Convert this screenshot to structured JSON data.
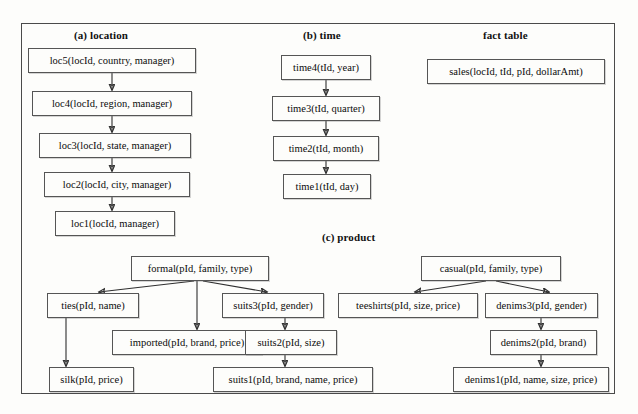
{
  "figure": {
    "sections": [
      {
        "id": "location",
        "label": "(a) location",
        "x": 74,
        "y": 29
      },
      {
        "id": "time",
        "label": "(b) time",
        "x": 303,
        "y": 29
      },
      {
        "id": "fact",
        "label": "fact table",
        "x": 483,
        "y": 29
      },
      {
        "id": "product",
        "label": "(c) product",
        "x": 322,
        "y": 231
      }
    ],
    "nodes": [
      {
        "id": "loc5",
        "label": "loc5(locId, country, manager)",
        "x": 28,
        "y": 48,
        "w": 168,
        "h": 25
      },
      {
        "id": "loc4",
        "label": "loc4(locId, region, manager)",
        "x": 32,
        "y": 91,
        "w": 160,
        "h": 25
      },
      {
        "id": "loc3",
        "label": "loc3(locId, state, manager)",
        "x": 39,
        "y": 133,
        "w": 152,
        "h": 25
      },
      {
        "id": "loc2",
        "label": "loc2(locId, city, manager)",
        "x": 44,
        "y": 172,
        "w": 146,
        "h": 25
      },
      {
        "id": "loc1",
        "label": "loc1(locId, manager)",
        "x": 55,
        "y": 211,
        "w": 120,
        "h": 25
      },
      {
        "id": "time4",
        "label": "time4(tId, year)",
        "x": 281,
        "y": 55,
        "w": 90,
        "h": 25
      },
      {
        "id": "time3",
        "label": "time3(tId, quarter)",
        "x": 272,
        "y": 96,
        "w": 108,
        "h": 25
      },
      {
        "id": "time2",
        "label": "time2(tId, month)",
        "x": 273,
        "y": 136,
        "w": 106,
        "h": 25
      },
      {
        "id": "time1",
        "label": "time1(tId, day)",
        "x": 283,
        "y": 174,
        "w": 88,
        "h": 25
      },
      {
        "id": "sales",
        "label": "sales(locId, tId, pId, dollarAmt)",
        "x": 427,
        "y": 59,
        "w": 178,
        "h": 25
      },
      {
        "id": "formal",
        "label": "formal(pId, family, type)",
        "x": 131,
        "y": 256,
        "w": 138,
        "h": 25
      },
      {
        "id": "ties",
        "label": "ties(pId, name)",
        "x": 47,
        "y": 293,
        "w": 92,
        "h": 25
      },
      {
        "id": "imported",
        "label": "imported(pId, brand, price)",
        "x": 112,
        "y": 330,
        "w": 150,
        "h": 25
      },
      {
        "id": "silk",
        "label": "silk(pId, price)",
        "x": 49,
        "y": 367,
        "w": 85,
        "h": 25
      },
      {
        "id": "suits3",
        "label": "suits3(pId, gender)",
        "x": 222,
        "y": 293,
        "w": 102,
        "h": 25
      },
      {
        "id": "suits2",
        "label": "suits2(pId, size)",
        "x": 245,
        "y": 330,
        "w": 92,
        "h": 25
      },
      {
        "id": "suits1",
        "label": "suits1(pId, brand, name, price)",
        "x": 213,
        "y": 367,
        "w": 160,
        "h": 25
      },
      {
        "id": "casual",
        "label": "casual(pId, family, type)",
        "x": 421,
        "y": 256,
        "w": 140,
        "h": 25
      },
      {
        "id": "teeshirts",
        "label": "teeshirts(pId, size, price)",
        "x": 338,
        "y": 293,
        "w": 140,
        "h": 25
      },
      {
        "id": "denims3",
        "label": "denims3(pId, gender)",
        "x": 485,
        "y": 293,
        "w": 113,
        "h": 25
      },
      {
        "id": "denims2",
        "label": "denims2(pId, brand)",
        "x": 490,
        "y": 330,
        "w": 107,
        "h": 25
      },
      {
        "id": "denims1",
        "label": "denims1(pId, name, size, price)",
        "x": 453,
        "y": 367,
        "w": 156,
        "h": 25
      }
    ],
    "edges": [
      {
        "from": "loc5",
        "to": "loc4",
        "kind": "vertical",
        "x": 112,
        "y1": 73,
        "y2": 91
      },
      {
        "from": "loc4",
        "to": "loc3",
        "kind": "vertical",
        "x": 112,
        "y1": 116,
        "y2": 133
      },
      {
        "from": "loc3",
        "to": "loc2",
        "kind": "vertical",
        "x": 112,
        "y1": 158,
        "y2": 172
      },
      {
        "from": "loc2",
        "to": "loc1",
        "kind": "vertical",
        "x": 112,
        "y1": 197,
        "y2": 211
      },
      {
        "from": "time4",
        "to": "time3",
        "kind": "vertical",
        "x": 326,
        "y1": 80,
        "y2": 96
      },
      {
        "from": "time3",
        "to": "time2",
        "kind": "vertical",
        "x": 326,
        "y1": 121,
        "y2": 136
      },
      {
        "from": "time2",
        "to": "time1",
        "kind": "vertical",
        "x": 326,
        "y1": 161,
        "y2": 174
      },
      {
        "from": "formal",
        "to": "ties",
        "kind": "diagonal",
        "x1": 194,
        "y1": 281,
        "x2": 99,
        "y2": 293
      },
      {
        "from": "formal",
        "to": "imported",
        "kind": "vertical",
        "x": 197,
        "y1": 281,
        "y2": 330
      },
      {
        "from": "formal",
        "to": "suits3",
        "kind": "diagonal",
        "x1": 203,
        "y1": 281,
        "x2": 267,
        "y2": 293
      },
      {
        "from": "ties",
        "to": "silk",
        "kind": "vertical",
        "x": 66,
        "y1": 318,
        "y2": 367
      },
      {
        "from": "suits3",
        "to": "suits2",
        "kind": "vertical",
        "x": 285,
        "y1": 318,
        "y2": 330
      },
      {
        "from": "suits2",
        "to": "suits1",
        "kind": "vertical",
        "x": 285,
        "y1": 355,
        "y2": 367
      },
      {
        "from": "casual",
        "to": "teeshirts",
        "kind": "diagonal",
        "x1": 486,
        "y1": 281,
        "x2": 415,
        "y2": 293
      },
      {
        "from": "casual",
        "to": "denims3",
        "kind": "diagonal",
        "x1": 496,
        "y1": 281,
        "x2": 549,
        "y2": 293
      },
      {
        "from": "denims3",
        "to": "denims2",
        "kind": "vertical",
        "x": 541,
        "y1": 318,
        "y2": 330
      },
      {
        "from": "denims2",
        "to": "denims1",
        "kind": "vertical",
        "x": 541,
        "y1": 355,
        "y2": 367
      }
    ]
  }
}
